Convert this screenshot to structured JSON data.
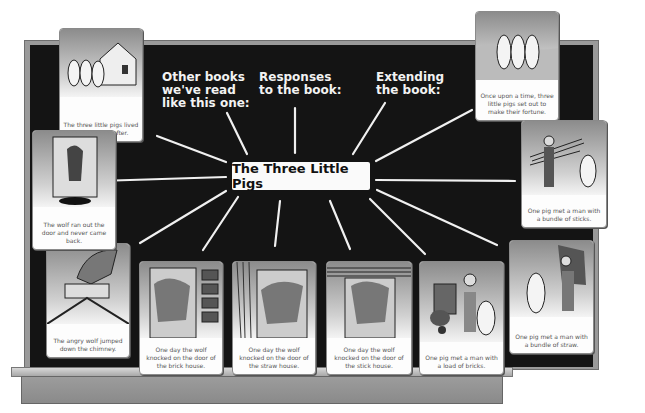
{
  "board": {
    "title": "The Three Little Pigs",
    "headings": [
      {
        "id": "other-books",
        "text": "Other books\nwe've read\nlike this one:"
      },
      {
        "id": "responses",
        "text": "Responses\nto the book:"
      },
      {
        "id": "extending",
        "text": "Extending\nthe book:"
      }
    ],
    "colors": {
      "board": "#141414",
      "frame": "#9a9a9a",
      "card": "#fdfdfd",
      "chalk": "#f2f2f2"
    }
  },
  "cards": [
    {
      "id": "happily-ever-after",
      "caption": "The three little pigs lived happily ever after.",
      "illustration": "three-pigs-house-icon"
    },
    {
      "id": "once-upon-a-time",
      "caption": "Once upon a time, three little pigs set out to make their fortune.",
      "illustration": "three-pigs-icon"
    },
    {
      "id": "bundle-of-sticks",
      "caption": "One pig met a man with a bundle of sticks.",
      "illustration": "man-sticks-pig-icon"
    },
    {
      "id": "bundle-of-straw",
      "caption": "One pig met a man with a bundle of straw.",
      "illustration": "man-straw-pig-icon"
    },
    {
      "id": "load-of-bricks",
      "caption": "One pig met a man with a load of bricks.",
      "illustration": "man-bricks-pig-icon"
    },
    {
      "id": "stick-house",
      "caption": "One day the wolf knocked on the door of the stick house.",
      "illustration": "wolf-stick-door-icon"
    },
    {
      "id": "straw-house",
      "caption": "One day the wolf knocked on the door of the straw house.",
      "illustration": "wolf-straw-door-icon"
    },
    {
      "id": "brick-house",
      "caption": "One day the wolf knocked on the door of the brick house.",
      "illustration": "wolf-brick-door-icon"
    },
    {
      "id": "chimney",
      "caption": "The angry wolf jumped down the chimney.",
      "illustration": "wolf-chimney-icon"
    },
    {
      "id": "ran-out",
      "caption": "The wolf ran out the door and never came back.",
      "illustration": "wolf-door-icon"
    }
  ]
}
